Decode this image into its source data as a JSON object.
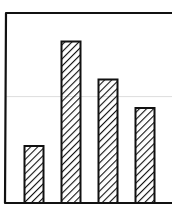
{
  "chart_data": {
    "type": "bar",
    "style": "hand-drawn, diagonal hatch fill",
    "title": "",
    "xlabel": "",
    "ylabel": "",
    "categories": [
      "",
      "",
      "",
      ""
    ],
    "values": [
      3.0,
      8.5,
      6.5,
      5.0
    ],
    "ylim": [
      0,
      10
    ],
    "grid": {
      "horizontal_lines": [
        5.6
      ],
      "color": "#dddddd"
    },
    "legend": null,
    "colors": {
      "bar_stroke": "#111111",
      "hatch": "#111111",
      "bar_fill": "#ffffff",
      "frame": "#111111"
    }
  },
  "footer": {
    "label": ""
  }
}
